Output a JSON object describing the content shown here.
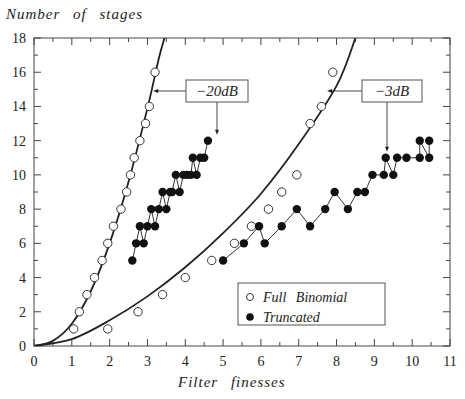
{
  "chart_data": {
    "type": "scatter",
    "title": "",
    "xlabel": "Filter finesses",
    "ylabel": "Number of stages",
    "xlim": [
      0,
      11
    ],
    "ylim": [
      0,
      18
    ],
    "x_ticks": [
      0,
      1,
      2,
      3,
      4,
      5,
      6,
      7,
      8,
      9,
      10,
      11
    ],
    "y_ticks": [
      0,
      2,
      4,
      6,
      8,
      10,
      12,
      14,
      16,
      18
    ],
    "grid": false,
    "legend": {
      "position": "lower right",
      "entries": [
        {
          "marker": "open-circle",
          "label": "Full Binomial"
        },
        {
          "marker": "filled-circle",
          "label": "Truncated"
        }
      ]
    },
    "annotations": [
      {
        "text": "-20dB",
        "label_display": "−20dB",
        "arrows_to": [
          "Full Binomial -20dB curve at y=15",
          "Truncated -20dB point at x=4.6,y=12"
        ]
      },
      {
        "text": "-3dB",
        "label_display": "−3dB",
        "arrows_to": [
          "Full Binomial -3dB curve at y=15",
          "Truncated -3dB point at x=9.3,y=11"
        ]
      }
    ],
    "series": [
      {
        "name": "Full Binomial -20dB (points)",
        "marker": "open-circle",
        "x": [
          1.05,
          1.2,
          1.4,
          1.6,
          1.8,
          1.95,
          2.1,
          2.3,
          2.45,
          2.55,
          2.65,
          2.8,
          2.95,
          3.05,
          3.2
        ],
        "y": [
          1,
          2,
          3,
          4,
          5,
          6,
          7,
          8,
          9,
          10,
          11,
          12,
          13,
          14,
          16
        ]
      },
      {
        "name": "Full Binomial -20dB (fit curve)",
        "marker": "line",
        "x": [
          0,
          0.5,
          1,
          1.5,
          2,
          2.5,
          3,
          3.3,
          3.45
        ],
        "y": [
          0,
          0.3,
          1.3,
          3.2,
          6.0,
          9.6,
          13.9,
          16.8,
          18
        ]
      },
      {
        "name": "Full Binomial -3dB (points)",
        "marker": "open-circle",
        "x": [
          1.95,
          2.75,
          3.4,
          4.0,
          4.7,
          5.3,
          5.75,
          6.2,
          6.55,
          6.95,
          7.3,
          7.6,
          7.9
        ],
        "y": [
          1,
          2,
          3,
          4,
          5,
          6,
          7,
          8,
          9,
          10,
          13,
          14,
          16
        ],
        "note": "approximate"
      },
      {
        "name": "Full Binomial -3dB (fit curve)",
        "marker": "line",
        "x": [
          0,
          1,
          2,
          3,
          4,
          5,
          6,
          7,
          8,
          8.5
        ],
        "y": [
          0,
          0.4,
          1.5,
          2.9,
          4.6,
          6.6,
          8.9,
          11.8,
          15.2,
          18
        ]
      },
      {
        "name": "Truncated -20dB",
        "marker": "filled-circle",
        "x": [
          2.6,
          2.7,
          2.8,
          2.9,
          3.0,
          3.1,
          3.2,
          3.3,
          3.4,
          3.5,
          3.6,
          3.65,
          3.75,
          3.85,
          3.95,
          4.05,
          4.15,
          4.2,
          4.3,
          4.4,
          4.5,
          4.6
        ],
        "y": [
          5,
          6,
          7,
          6,
          7,
          8,
          7,
          8,
          9,
          8,
          9,
          9,
          10,
          9,
          10,
          10,
          10,
          11,
          10,
          11,
          11,
          12
        ]
      },
      {
        "name": "Truncated -3dB",
        "marker": "filled-circle",
        "x": [
          5.0,
          5.55,
          5.95,
          6.1,
          6.55,
          6.95,
          7.3,
          7.7,
          7.95,
          8.3,
          8.55,
          8.75,
          8.95,
          9.25,
          9.3,
          9.5,
          9.6,
          9.85,
          10.2,
          10.2,
          10.45,
          10.45
        ],
        "y": [
          5,
          6,
          7,
          6,
          7,
          8,
          7,
          8,
          9,
          8,
          9,
          9,
          10,
          10,
          11,
          10,
          11,
          11,
          11,
          12,
          11,
          12
        ]
      }
    ]
  }
}
